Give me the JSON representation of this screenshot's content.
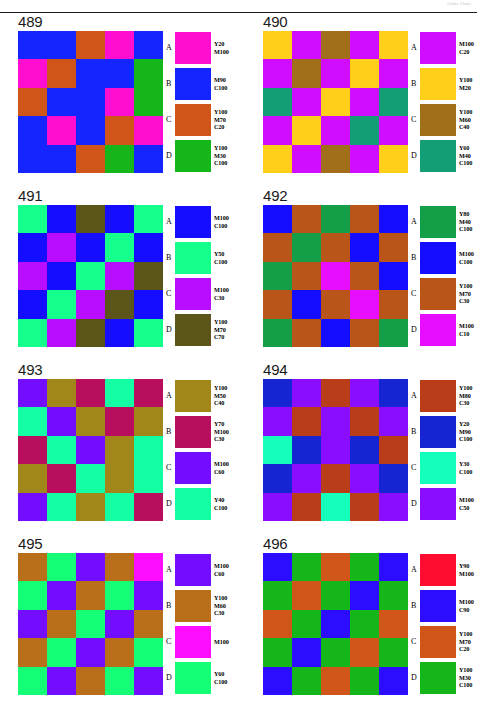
{
  "header": {
    "caption": "Color Chart"
  },
  "legend_letters": [
    "A",
    "B",
    "C",
    "D"
  ],
  "panels": [
    {
      "number": "489",
      "swatches": [
        {
          "letter": "A",
          "label": "Y20\nM100",
          "c": 0,
          "m": 100,
          "y": 20,
          "k": 0
        },
        {
          "letter": "B",
          "label": "M90\nC100",
          "c": 100,
          "m": 90,
          "y": 0,
          "k": 0
        },
        {
          "letter": "C",
          "label": "Y100\nM70\nC20",
          "c": 20,
          "m": 70,
          "y": 100,
          "k": 0
        },
        {
          "letter": "D",
          "label": "Y100\nM30\nC100",
          "c": 100,
          "m": 30,
          "y": 100,
          "k": 0
        }
      ],
      "matrix": [
        [
          1,
          1,
          2,
          0,
          1
        ],
        [
          0,
          2,
          1,
          1,
          3
        ],
        [
          2,
          1,
          1,
          0,
          3
        ],
        [
          1,
          0,
          1,
          2,
          0
        ],
        [
          1,
          1,
          2,
          3,
          1
        ]
      ]
    },
    {
      "number": "490",
      "swatches": [
        {
          "letter": "A",
          "label": "M100\nC20",
          "c": 20,
          "m": 100,
          "y": 0,
          "k": 0
        },
        {
          "letter": "B",
          "label": "Y100\nM20",
          "c": 0,
          "m": 20,
          "y": 100,
          "k": 0
        },
        {
          "letter": "C",
          "label": "Y100\nM60\nC40",
          "c": 40,
          "m": 60,
          "y": 100,
          "k": 0
        },
        {
          "letter": "D",
          "label": "Y60\nM40\nC100",
          "c": 100,
          "m": 40,
          "y": 60,
          "k": 0
        }
      ],
      "matrix": [
        [
          1,
          0,
          2,
          0,
          1
        ],
        [
          0,
          2,
          0,
          1,
          0
        ],
        [
          3,
          0,
          1,
          0,
          3
        ],
        [
          0,
          1,
          0,
          3,
          0
        ],
        [
          1,
          0,
          2,
          0,
          1
        ]
      ]
    },
    {
      "number": "491",
      "swatches": [
        {
          "letter": "A",
          "label": "M100\nC100",
          "c": 100,
          "m": 100,
          "y": 0,
          "k": 0
        },
        {
          "letter": "B",
          "label": "Y50\nC100",
          "c": 100,
          "m": 0,
          "y": 50,
          "k": 0
        },
        {
          "letter": "C",
          "label": "M100\nC30",
          "c": 30,
          "m": 100,
          "y": 0,
          "k": 0
        },
        {
          "letter": "D",
          "label": "Y100\nM70\nC70",
          "c": 70,
          "m": 70,
          "y": 100,
          "k": 0
        }
      ],
      "matrix": [
        [
          1,
          0,
          3,
          0,
          1
        ],
        [
          0,
          2,
          0,
          1,
          0
        ],
        [
          2,
          0,
          1,
          2,
          3
        ],
        [
          0,
          1,
          2,
          3,
          0
        ],
        [
          1,
          2,
          3,
          0,
          1
        ]
      ]
    },
    {
      "number": "492",
      "swatches": [
        {
          "letter": "A",
          "label": "Y80\nM40\nC100",
          "c": 100,
          "m": 40,
          "y": 80,
          "k": 0
        },
        {
          "letter": "B",
          "label": "M100\nC100",
          "c": 100,
          "m": 100,
          "y": 0,
          "k": 0
        },
        {
          "letter": "C",
          "label": "Y100\nM70\nC30",
          "c": 30,
          "m": 70,
          "y": 100,
          "k": 0
        },
        {
          "letter": "D",
          "label": "M100\nC10",
          "c": 10,
          "m": 100,
          "y": 0,
          "k": 0
        }
      ],
      "matrix": [
        [
          1,
          2,
          0,
          2,
          1
        ],
        [
          2,
          0,
          2,
          1,
          2
        ],
        [
          0,
          2,
          3,
          2,
          1
        ],
        [
          2,
          1,
          2,
          3,
          2
        ],
        [
          0,
          2,
          1,
          2,
          0
        ]
      ]
    },
    {
      "number": "493",
      "swatches": [
        {
          "letter": "A",
          "label": "Y100\nM50\nC40",
          "c": 40,
          "m": 50,
          "y": 100,
          "k": 0
        },
        {
          "letter": "B",
          "label": "Y70\nM100\nC30",
          "c": 30,
          "m": 100,
          "y": 70,
          "k": 0
        },
        {
          "letter": "C",
          "label": "M100\nC60",
          "c": 60,
          "m": 100,
          "y": 0,
          "k": 0
        },
        {
          "letter": "D",
          "label": "Y40\nC100",
          "c": 100,
          "m": 0,
          "y": 40,
          "k": 0
        }
      ],
      "matrix": [
        [
          2,
          0,
          1,
          3,
          1
        ],
        [
          3,
          2,
          0,
          1,
          0
        ],
        [
          1,
          3,
          2,
          0,
          3
        ],
        [
          0,
          1,
          3,
          0,
          3
        ],
        [
          2,
          3,
          0,
          3,
          1
        ]
      ]
    },
    {
      "number": "494",
      "swatches": [
        {
          "letter": "A",
          "label": "Y100\nM80\nC30",
          "c": 30,
          "m": 80,
          "y": 100,
          "k": 0
        },
        {
          "letter": "B",
          "label": "Y20\nM90\nC100",
          "c": 100,
          "m": 90,
          "y": 20,
          "k": 0
        },
        {
          "letter": "C",
          "label": "Y30\nC100",
          "c": 100,
          "m": 0,
          "y": 30,
          "k": 0
        },
        {
          "letter": "D",
          "label": "M100\nC50",
          "c": 50,
          "m": 100,
          "y": 0,
          "k": 0
        }
      ],
      "matrix": [
        [
          1,
          3,
          0,
          3,
          1
        ],
        [
          3,
          0,
          3,
          0,
          3
        ],
        [
          2,
          1,
          3,
          1,
          0
        ],
        [
          1,
          3,
          0,
          3,
          1
        ],
        [
          3,
          0,
          2,
          0,
          3
        ]
      ]
    },
    {
      "number": "495",
      "swatches": [
        {
          "letter": "A",
          "label": "M100\nC60",
          "c": 60,
          "m": 100,
          "y": 0,
          "k": 0
        },
        {
          "letter": "B",
          "label": "Y100\nM60\nC30",
          "c": 30,
          "m": 60,
          "y": 100,
          "k": 0
        },
        {
          "letter": "C",
          "label": "M100",
          "c": 0,
          "m": 100,
          "y": 0,
          "k": 0
        },
        {
          "letter": "D",
          "label": "Y60\nC100",
          "c": 100,
          "m": 0,
          "y": 60,
          "k": 0
        }
      ],
      "matrix": [
        [
          1,
          3,
          0,
          1,
          2
        ],
        [
          3,
          0,
          1,
          3,
          0
        ],
        [
          0,
          1,
          3,
          0,
          1
        ],
        [
          1,
          3,
          0,
          1,
          3
        ],
        [
          3,
          0,
          1,
          3,
          0
        ]
      ]
    },
    {
      "number": "496",
      "swatches": [
        {
          "letter": "A",
          "label": "Y90\nM100",
          "c": 0,
          "m": 100,
          "y": 90,
          "k": 0
        },
        {
          "letter": "B",
          "label": "M100\nC90",
          "c": 90,
          "m": 100,
          "y": 0,
          "k": 0
        },
        {
          "letter": "C",
          "label": "Y100\nM70\nC20",
          "c": 20,
          "m": 70,
          "y": 100,
          "k": 0
        },
        {
          "letter": "D",
          "label": "Y100\nM30\nC100",
          "c": 100,
          "m": 30,
          "y": 100,
          "k": 0
        }
      ],
      "matrix": [
        [
          1,
          3,
          2,
          3,
          1
        ],
        [
          3,
          2,
          3,
          1,
          3
        ],
        [
          2,
          3,
          1,
          3,
          2
        ],
        [
          3,
          1,
          3,
          2,
          3
        ],
        [
          1,
          3,
          2,
          3,
          1
        ]
      ]
    }
  ]
}
